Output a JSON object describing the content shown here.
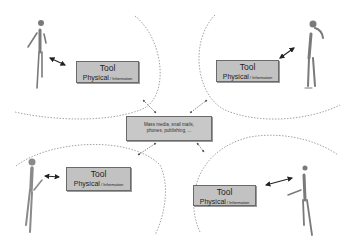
{
  "diagram": {
    "type": "communication-model",
    "center": {
      "label_line1": "Mass media, snail mails,",
      "label_line2": "phones, publishing, ..."
    },
    "groups": [
      {
        "position": "top-left",
        "tool_title": "Tool",
        "tool_sub_main": "Physical",
        "tool_sub_small": " / Information"
      },
      {
        "position": "top-right",
        "tool_title": "Tool",
        "tool_sub_main": "Physical",
        "tool_sub_small": " / Information"
      },
      {
        "position": "bottom-left",
        "tool_title": "Tool",
        "tool_sub_main": "Physical",
        "tool_sub_small": " / Information"
      },
      {
        "position": "bottom-right",
        "tool_title": "Tool",
        "tool_sub_main": "Physical",
        "tool_sub_small": " / Information"
      }
    ],
    "colors": {
      "box_fill": "#c2c2c2",
      "box_border": "#6a6a6a",
      "dashed_line": "#888888",
      "arrow": "#222222",
      "figure": "#7a7a7a"
    }
  }
}
